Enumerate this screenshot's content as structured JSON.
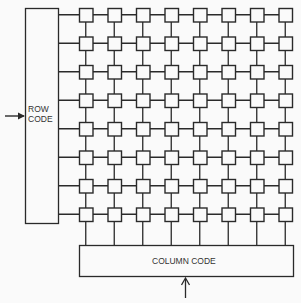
{
  "diagram": {
    "row_code_label_line1": "ROW",
    "row_code_label_line2": "CODE",
    "column_code_label": "COLUMN CODE",
    "grid": {
      "rows": 8,
      "columns": 8
    },
    "stroke_color": "#2a2a2a",
    "background_color": "#fafafa"
  }
}
